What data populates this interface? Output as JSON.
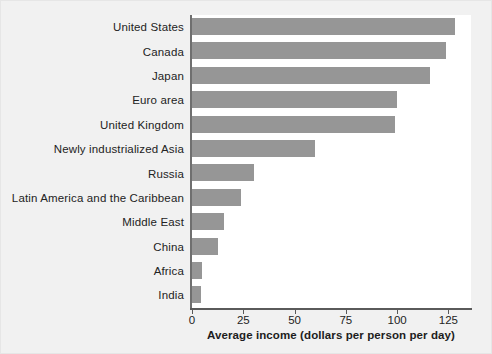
{
  "chart_data": {
    "type": "bar",
    "orientation": "horizontal",
    "title": "",
    "xlabel": "Average income (dollars per person per day)",
    "ylabel": "",
    "xlim": [
      0,
      136
    ],
    "xticks": [
      0,
      25,
      50,
      75,
      100,
      125
    ],
    "xtick_labels": [
      "0",
      "25",
      "50",
      "75",
      "100",
      "125"
    ],
    "grid": false,
    "legend": false,
    "bar_color": "#969696",
    "axis_color": "#5a5a5a",
    "text_color": "#232323",
    "panel_color": "#ffffff",
    "figure_color": "#f1f1f1",
    "categories": [
      "United States",
      "Canada",
      "Japan",
      "Euro area",
      "United Kingdom",
      "Newly industrialized Asia",
      "Russia",
      "Latin America and the Caribbean",
      "Middle East",
      "China",
      "Africa",
      "India"
    ],
    "values": [
      128,
      124,
      116,
      100,
      99,
      60,
      30,
      24,
      15.5,
      12.5,
      5,
      4.3
    ]
  }
}
